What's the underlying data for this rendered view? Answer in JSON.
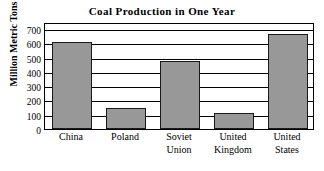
{
  "chart_data": {
    "type": "bar",
    "title": "Coal Production in One Year",
    "xlabel": "",
    "ylabel": "Million Metric Tons",
    "categories": [
      "China",
      "Poland",
      "Soviet Union",
      "United Kingdom",
      "United States"
    ],
    "values": [
      610,
      150,
      478,
      110,
      665
    ],
    "ylim": [
      0,
      750
    ],
    "yticks": [
      0,
      100,
      200,
      300,
      400,
      500,
      600,
      700
    ],
    "ytick_labels": [
      "0",
      "100",
      "200",
      "300",
      "400",
      "500",
      "600",
      "700"
    ],
    "grid": true,
    "legend": false,
    "bar_color": "#989898",
    "bar_edge_color": "#1a1a1a",
    "frame_color": "#000000",
    "background_color": "#ffffff"
  }
}
